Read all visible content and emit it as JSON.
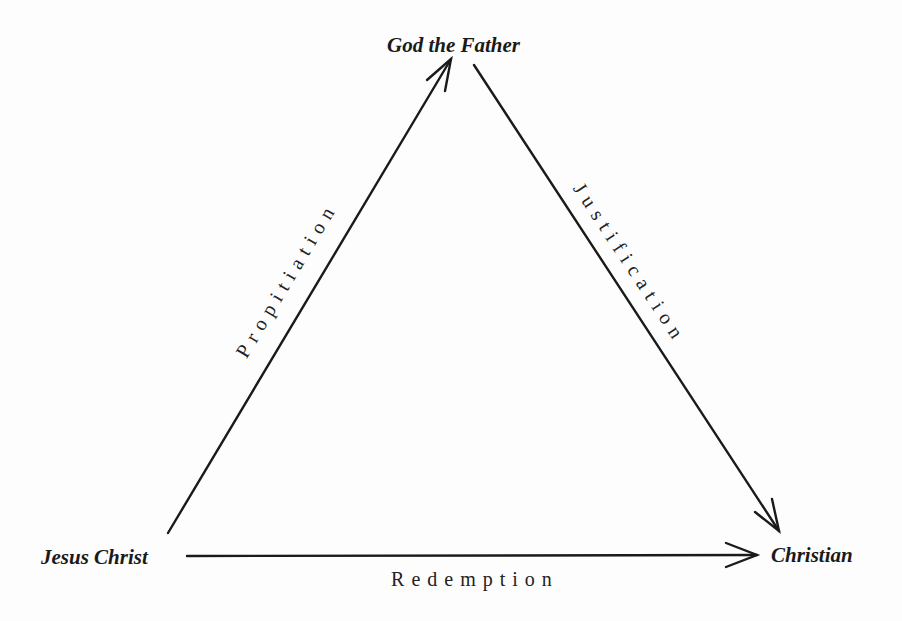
{
  "diagram": {
    "type": "triangle-flow",
    "nodes": {
      "top": {
        "label": "God the Father"
      },
      "left": {
        "label": "Jesus Christ"
      },
      "right": {
        "label": "Christian"
      }
    },
    "edges": [
      {
        "from": "Jesus Christ",
        "to": "God the Father",
        "label": "Propitiation"
      },
      {
        "from": "God the Father",
        "to": "Christian",
        "label": "Justification"
      },
      {
        "from": "Jesus Christ",
        "to": "Christian",
        "label": "Redemption"
      }
    ],
    "colors": {
      "line": "#1a1a1a",
      "background": "#fdfdfd",
      "text": "#1a1a1a"
    }
  }
}
